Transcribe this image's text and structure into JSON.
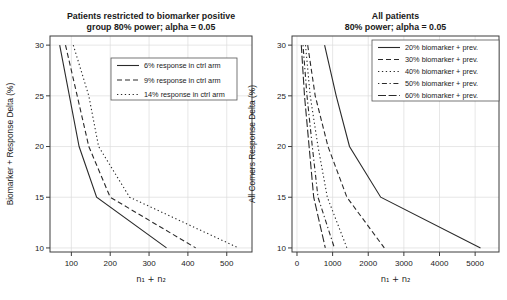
{
  "palette": {
    "background": "#ffffff",
    "line": "#2a2a2a",
    "grid": "#dcdcdc",
    "text": "#1a1a1a",
    "axis": "#3c3c3c",
    "legend_border": "#555555"
  },
  "chart_data": [
    {
      "type": "line",
      "title_lines": [
        "Patients restricted to biomarker positive",
        "group 80% power; alpha = 0.05"
      ],
      "xlabel": "n₁ + n₂",
      "ylabel": "Biomarker + Response Delta (%)",
      "x_ticks": [
        100,
        200,
        300,
        400,
        500
      ],
      "y_ticks": [
        10,
        15,
        20,
        25,
        30
      ],
      "xlim": [
        45,
        565
      ],
      "ylim": [
        9.6,
        30.9
      ],
      "grid": true,
      "legend_position": "top-right-inner",
      "series": [
        {
          "name": "6% response in ctrl arm",
          "linetype": "solid",
          "y": [
            30,
            25,
            20,
            15,
            10
          ],
          "x": [
            70,
            95,
            120,
            165,
            345
          ]
        },
        {
          "name": "9% response in ctrl arm",
          "linetype": "dashed",
          "y": [
            30,
            25,
            20,
            15,
            10
          ],
          "x": [
            85,
            115,
            145,
            200,
            420
          ]
        },
        {
          "name": "14% response in ctrl arm",
          "linetype": "dotted",
          "y": [
            30,
            25,
            20,
            15,
            10
          ],
          "x": [
            105,
            145,
            170,
            250,
            530
          ]
        }
      ]
    },
    {
      "type": "line",
      "title_lines": [
        "All patients",
        "80% power; alpha = 0.05"
      ],
      "xlabel": "n₁ + n₂",
      "ylabel": "All Comers Response Delta (%)",
      "x_ticks": [
        0,
        1000,
        2000,
        3000,
        4000,
        5000
      ],
      "y_ticks": [
        10,
        15,
        20,
        25,
        30
      ],
      "xlim": [
        -140,
        5670
      ],
      "ylim": [
        9.6,
        30.9
      ],
      "grid": true,
      "legend_position": "top-right-inner",
      "series": [
        {
          "name": "20% biomarker + prev.",
          "linetype": "solid",
          "y": [
            30,
            25,
            20,
            15,
            10
          ],
          "x": [
            775,
            1100,
            1475,
            2350,
            5150
          ]
        },
        {
          "name": "30% biomarker + prev.",
          "linetype": "dashed",
          "y": [
            30,
            25,
            20,
            15,
            10
          ],
          "x": [
            300,
            510,
            870,
            1400,
            2450
          ]
        },
        {
          "name": "40% biomarker + prev.",
          "linetype": "dotted",
          "y": [
            30,
            25,
            20,
            15,
            10
          ],
          "x": [
            240,
            370,
            590,
            850,
            1400
          ]
        },
        {
          "name": "50% biomarker + prev.",
          "linetype": "dotdash",
          "y": [
            30,
            25,
            20,
            15,
            10
          ],
          "x": [
            170,
            280,
            430,
            590,
            1050
          ]
        },
        {
          "name": "60% biomarker + prev.",
          "linetype": "longdash",
          "y": [
            30,
            25,
            20,
            15,
            10
          ],
          "x": [
            120,
            210,
            340,
            470,
            795
          ]
        }
      ]
    }
  ]
}
